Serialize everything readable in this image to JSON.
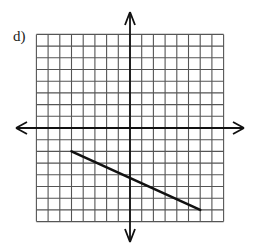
{
  "problem_label": "d)",
  "chart_data": {
    "type": "line",
    "title": "d)",
    "xlabel": "",
    "ylabel": "",
    "grid": true,
    "xlim": [
      -8,
      8
    ],
    "ylim": [
      -8,
      8
    ],
    "grid_step": 1,
    "axes_arrows": true,
    "series": [
      {
        "name": "segment",
        "x": [
          -5,
          6
        ],
        "y": [
          -2,
          -7
        ]
      }
    ],
    "annotations": []
  },
  "colors": {
    "grid": "#555555",
    "axis": "#111111",
    "line": "#111111",
    "background": "#ffffff"
  }
}
